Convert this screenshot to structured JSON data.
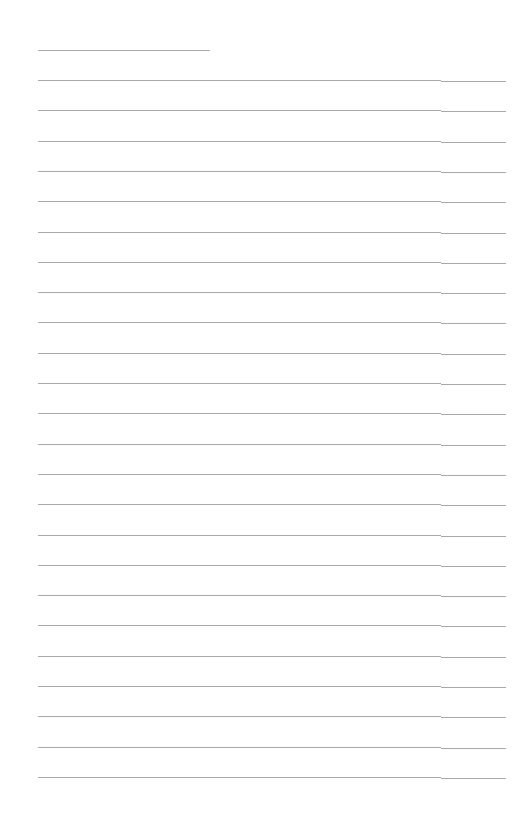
{
  "page": {
    "type": "blank-ruled-sheet",
    "background": "#ffffff",
    "rule_color": "#a8a8a8",
    "first_rule": {
      "y": 50,
      "x_start": 38,
      "x_end": 210
    },
    "rules": {
      "count": 24,
      "start_y": 80,
      "spacing": 30.3,
      "x_start": 38,
      "x_end": 506,
      "break_x": 441
    }
  }
}
